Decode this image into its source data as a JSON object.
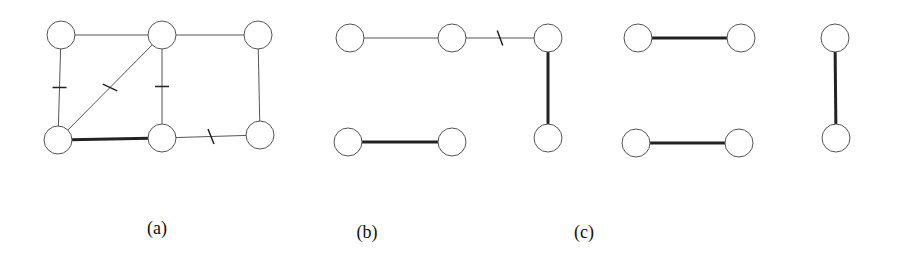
{
  "panels": [
    {
      "label": "(a)",
      "label_pos": [
        157,
        218
      ],
      "nodes": [
        [
          61,
          35
        ],
        [
          162,
          35
        ],
        [
          258,
          35
        ],
        [
          58,
          140
        ],
        [
          162,
          138
        ],
        [
          260,
          135
        ]
      ],
      "edges": [
        {
          "from": 0,
          "to": 1,
          "style": "thin"
        },
        {
          "from": 1,
          "to": 2,
          "style": "thin"
        },
        {
          "from": 0,
          "to": 3,
          "style": "thin",
          "tick": "h"
        },
        {
          "from": 1,
          "to": 3,
          "style": "thin",
          "tick": "slash"
        },
        {
          "from": 1,
          "to": 4,
          "style": "thin",
          "tick": "h"
        },
        {
          "from": 2,
          "to": 5,
          "style": "thin"
        },
        {
          "from": 3,
          "to": 4,
          "style": "thick"
        },
        {
          "from": 4,
          "to": 5,
          "style": "thin",
          "tick": "slash"
        }
      ]
    },
    {
      "label": "(b)",
      "label_pos": [
        367,
        222
      ],
      "nodes": [
        [
          350,
          38
        ],
        [
          452,
          38
        ],
        [
          548,
          38
        ],
        [
          348,
          142
        ],
        [
          452,
          142
        ],
        [
          548,
          138
        ]
      ],
      "edges": [
        {
          "from": 0,
          "to": 1,
          "style": "thin"
        },
        {
          "from": 1,
          "to": 2,
          "style": "thin",
          "tick": "slash"
        },
        {
          "from": 2,
          "to": 5,
          "style": "thick"
        },
        {
          "from": 3,
          "to": 4,
          "style": "thick"
        }
      ]
    },
    {
      "label": "(c)",
      "label_pos": [
        584,
        222
      ],
      "nodes": [
        [
          638,
          38
        ],
        [
          741,
          38
        ],
        [
          835,
          38
        ],
        [
          636,
          143
        ],
        [
          739,
          143
        ],
        [
          836,
          138
        ]
      ],
      "edges": [
        {
          "from": 0,
          "to": 1,
          "style": "thick"
        },
        {
          "from": 3,
          "to": 4,
          "style": "thick"
        },
        {
          "from": 2,
          "to": 5,
          "style": "thick"
        }
      ]
    }
  ],
  "node_radius": 14
}
